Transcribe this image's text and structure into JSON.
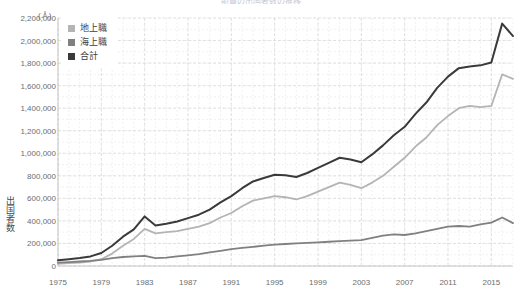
{
  "title_fragment": "船員の出国者数の推移",
  "axes": {
    "y_unit": "(人)",
    "y_title": "出国者数",
    "y_ticks": [
      "2,200,000",
      "2,000,000",
      "1,800,000",
      "1,600,000",
      "1,400,000",
      "1,200,000",
      "1,000,000",
      "800,000",
      "600,000",
      "400,000",
      "200,000",
      "0"
    ],
    "x_ticks": [
      "1975",
      "1979",
      "1983",
      "1987",
      "1991",
      "1995",
      "1999",
      "2003",
      "2007",
      "2011",
      "2015"
    ]
  },
  "legend": {
    "items": [
      {
        "label": "地上職",
        "color": "#b4b4b4"
      },
      {
        "label": "海上職",
        "color": "#808080"
      },
      {
        "label": "合計",
        "color": "#3a3a3a"
      }
    ]
  },
  "colors": {
    "grid_major": "#d8d8d8",
    "grid_minor": "#e8e8e8",
    "axis": "#bdbdbd",
    "text": "#6d6d6d",
    "series_chijo": "#b4b4b4",
    "series_kaijo": "#808080",
    "series_total": "#3a3a3a"
  },
  "chart_data": {
    "type": "line",
    "title": "船員の出国者数の推移",
    "xlabel": "",
    "ylabel": "出国者数",
    "y_unit": "(人)",
    "xlim": [
      1975,
      2017
    ],
    "ylim": [
      0,
      2200000
    ],
    "y_tick_step": 200000,
    "grid": true,
    "legend_position": "top-left",
    "x": [
      1975,
      1976,
      1977,
      1978,
      1979,
      1980,
      1981,
      1982,
      1983,
      1984,
      1985,
      1986,
      1987,
      1988,
      1989,
      1990,
      1991,
      1992,
      1993,
      1994,
      1995,
      1996,
      1997,
      1998,
      1999,
      2000,
      2001,
      2002,
      2003,
      2004,
      2005,
      2006,
      2007,
      2008,
      2009,
      2010,
      2011,
      2012,
      2013,
      2014,
      2015,
      2016,
      2017
    ],
    "series": [
      {
        "name": "地上職",
        "color": "#b4b4b4",
        "values": [
          20000,
          25000,
          30000,
          40000,
          60000,
          110000,
          180000,
          240000,
          330000,
          290000,
          300000,
          310000,
          330000,
          350000,
          380000,
          430000,
          470000,
          530000,
          580000,
          600000,
          620000,
          610000,
          590000,
          620000,
          660000,
          700000,
          740000,
          720000,
          690000,
          740000,
          800000,
          880000,
          960000,
          1060000,
          1140000,
          1250000,
          1330000,
          1400000,
          1420000,
          1410000,
          1420000,
          1700000,
          1660000
        ]
      },
      {
        "name": "海上職",
        "color": "#808080",
        "values": [
          30000,
          35000,
          40000,
          45000,
          55000,
          70000,
          80000,
          85000,
          90000,
          70000,
          75000,
          85000,
          95000,
          105000,
          120000,
          135000,
          150000,
          160000,
          170000,
          180000,
          190000,
          195000,
          200000,
          205000,
          210000,
          215000,
          220000,
          225000,
          230000,
          250000,
          270000,
          280000,
          275000,
          290000,
          310000,
          330000,
          350000,
          355000,
          350000,
          370000,
          385000,
          430000,
          380000
        ]
      },
      {
        "name": "合計",
        "color": "#3a3a3a",
        "values": [
          50000,
          60000,
          70000,
          85000,
          115000,
          180000,
          260000,
          325000,
          440000,
          360000,
          375000,
          395000,
          425000,
          455000,
          500000,
          565000,
          620000,
          690000,
          750000,
          780000,
          810000,
          805000,
          790000,
          825000,
          870000,
          915000,
          960000,
          945000,
          920000,
          990000,
          1070000,
          1160000,
          1235000,
          1350000,
          1450000,
          1580000,
          1680000,
          1755000,
          1770000,
          1780000,
          1805000,
          2150000,
          2040000
        ]
      }
    ]
  }
}
